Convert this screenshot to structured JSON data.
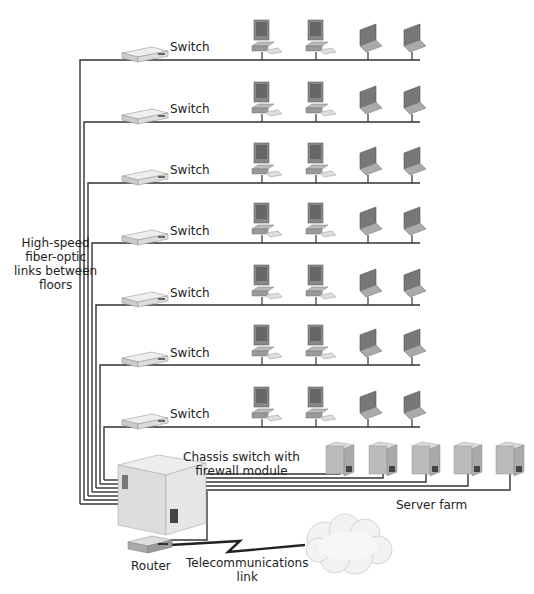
{
  "diagram": {
    "backbone_label": [
      "High-speed",
      "fiber-optic",
      "links between",
      "floors"
    ],
    "floors": [
      {
        "switch_label": "Switch",
        "devices": [
          "desktop",
          "desktop",
          "laptop",
          "laptop"
        ]
      },
      {
        "switch_label": "Switch",
        "devices": [
          "desktop",
          "desktop",
          "laptop",
          "laptop"
        ]
      },
      {
        "switch_label": "Switch",
        "devices": [
          "desktop",
          "desktop",
          "laptop",
          "laptop"
        ]
      },
      {
        "switch_label": "Switch",
        "devices": [
          "desktop",
          "desktop",
          "laptop",
          "laptop"
        ]
      },
      {
        "switch_label": "Switch",
        "devices": [
          "desktop",
          "desktop",
          "laptop",
          "laptop"
        ]
      },
      {
        "switch_label": "Switch",
        "devices": [
          "desktop",
          "desktop",
          "laptop",
          "laptop"
        ]
      },
      {
        "switch_label": "Switch",
        "devices": [
          "desktop",
          "desktop",
          "laptop",
          "laptop"
        ]
      }
    ],
    "chassis_label": [
      "Chassis switch with",
      "firewall module"
    ],
    "server_farm_label": "Server farm",
    "server_count": 5,
    "router_label": "Router",
    "telecom_label": [
      "Telecommunications",
      "link"
    ]
  }
}
